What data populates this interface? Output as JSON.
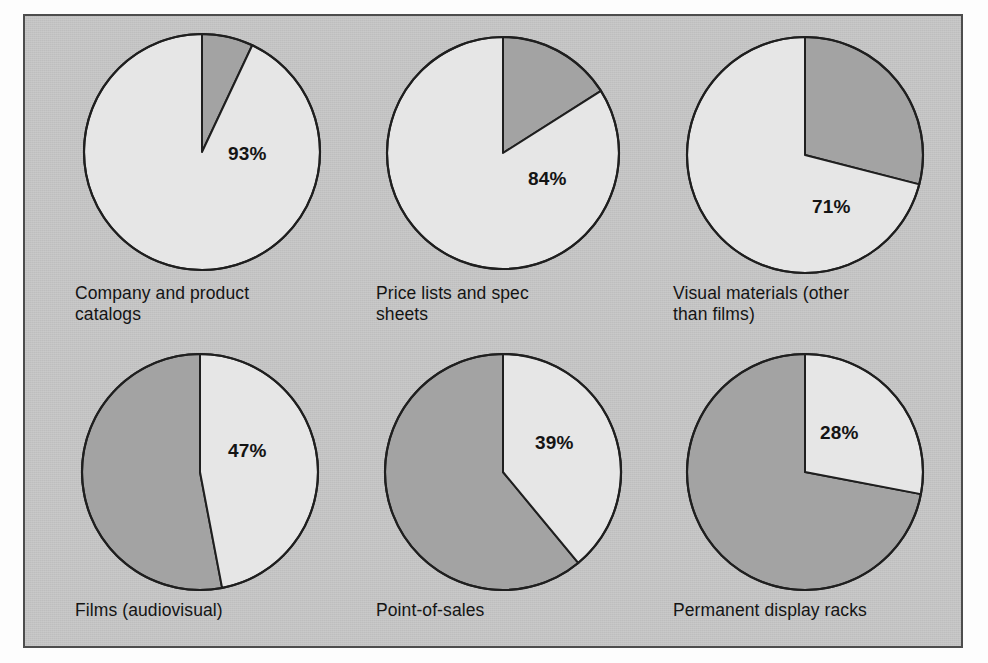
{
  "figure": {
    "background_color": "#fdfdfd",
    "plate_color": "#c3c3c3",
    "border_color": "#4d4d4d"
  },
  "chart_data": {
    "type": "pie",
    "title": "",
    "subtitle": "",
    "xlabel": "",
    "ylabel": "",
    "grid": false,
    "legend_position": "none",
    "value_unit": "%",
    "slice_colors": {
      "highlight": "#e6e6e6",
      "remainder": "#a3a3a3",
      "outline": "#1f1f1f"
    },
    "series": [
      {
        "name": "Yes",
        "values": [
          93,
          84,
          71,
          47,
          39,
          28
        ]
      },
      {
        "name": "Remainder",
        "values": [
          7,
          16,
          29,
          53,
          61,
          72
        ]
      }
    ],
    "categories": [
      "Company and product catalogs",
      "Price lists and spec sheets",
      "Visual materials (other than films)",
      "Films (audiovisual)",
      "Point-of-sales",
      "Permanent display racks"
    ],
    "charts": [
      {
        "id": "pie-company-and-product-catalogs",
        "label": "Company and product\ncatalogs",
        "value": 93,
        "value_label": "93%",
        "remainder": 7,
        "center_x": 202,
        "center_y": 152,
        "radius": 118,
        "highlight_direction": "counterclockwise",
        "label_x": 228,
        "label_y": 143,
        "caption_x": 75,
        "caption_y": 283
      },
      {
        "id": "pie-price-lists-and-spec-sheets",
        "label": "Price lists and spec\nsheets",
        "value": 84,
        "value_label": "84%",
        "remainder": 16,
        "center_x": 503,
        "center_y": 153,
        "radius": 116,
        "highlight_direction": "counterclockwise",
        "label_x": 528,
        "label_y": 168,
        "caption_x": 376,
        "caption_y": 283
      },
      {
        "id": "pie-visual-materials-other-than-films",
        "label": "Visual materials (other\nthan films)",
        "value": 71,
        "value_label": "71%",
        "remainder": 29,
        "center_x": 805,
        "center_y": 155,
        "radius": 118,
        "highlight_direction": "counterclockwise",
        "label_x": 812,
        "label_y": 196,
        "caption_x": 673,
        "caption_y": 283
      },
      {
        "id": "pie-films-audiovisual",
        "label": "Films (audiovisual)",
        "value": 47,
        "value_label": "47%",
        "remainder": 53,
        "center_x": 200,
        "center_y": 472,
        "radius": 118,
        "highlight_direction": "clockwise",
        "label_x": 228,
        "label_y": 440,
        "caption_x": 75,
        "caption_y": 600
      },
      {
        "id": "pie-point-of-sales",
        "label": "Point-of-sales",
        "value": 39,
        "value_label": "39%",
        "remainder": 61,
        "center_x": 503,
        "center_y": 472,
        "radius": 118,
        "highlight_direction": "clockwise",
        "label_x": 535,
        "label_y": 432,
        "caption_x": 376,
        "caption_y": 600
      },
      {
        "id": "pie-permanent-display-racks",
        "label": "Permanent display racks",
        "value": 28,
        "value_label": "28%",
        "remainder": 72,
        "center_x": 805,
        "center_y": 472,
        "radius": 118,
        "highlight_direction": "clockwise",
        "label_x": 820,
        "label_y": 422,
        "caption_x": 673,
        "caption_y": 600
      }
    ]
  }
}
